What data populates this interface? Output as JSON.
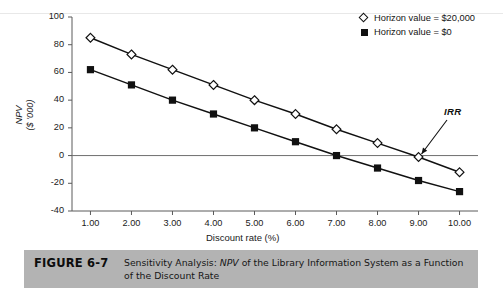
{
  "figure": {
    "label": "FIGURE 6-7",
    "caption_prefix": "Sensitivity Analysis: ",
    "caption_italic": "NPV",
    "caption_suffix": " of the Library Information System as a Function of the Discount Rate",
    "bar_color": "#b3b3b3"
  },
  "annotations": {
    "irr_label": "IRR"
  },
  "chart_data": {
    "type": "line",
    "title": "",
    "xlabel": "Discount rate (%)",
    "ylabel_line1": "NPV",
    "ylabel_line2": "($ '000)",
    "x": [
      1,
      2,
      3,
      4,
      5,
      6,
      7,
      8,
      9,
      10
    ],
    "categories": [
      "1.00",
      "2.00",
      "3.00",
      "4.00",
      "5.00",
      "6.00",
      "7.00",
      "8.00",
      "9.00",
      "10.00"
    ],
    "xtick_labels": [
      "1.00",
      "2.00",
      "3.00",
      "4.00",
      "5.00",
      "6.00",
      "7.00",
      "8.00",
      "9.00",
      "10.00"
    ],
    "ytick_labels": [
      "100",
      "80",
      "60",
      "40",
      "20",
      "0",
      "-20",
      "-40"
    ],
    "yticks": [
      100,
      80,
      60,
      40,
      20,
      0,
      -20,
      -40
    ],
    "xlim": [
      0.55,
      10.45
    ],
    "ylim": [
      -40,
      100
    ],
    "grid": false,
    "legend_position": "top-right",
    "zero_line": true,
    "series": [
      {
        "name": "Horizon value = $20,000",
        "marker": "open-diamond",
        "color": "#111111",
        "values": [
          85,
          73,
          62,
          51,
          40,
          30,
          19,
          9,
          -1,
          -12
        ]
      },
      {
        "name": "Horizon value = $0",
        "marker": "filled-square",
        "color": "#111111",
        "values": [
          62,
          51,
          40,
          30,
          20,
          10,
          0,
          -9,
          -18,
          -26
        ]
      }
    ],
    "annotations": [
      {
        "text": "IRR",
        "points_to_x": 9.0,
        "points_to_y": -1,
        "note": "internal rate of return where Horizon value = $20,000 curve crosses zero"
      }
    ]
  },
  "legend": {
    "items": [
      {
        "label": "Horizon value = $20,000",
        "marker": "open-diamond"
      },
      {
        "label": "Horizon value = $0",
        "marker": "filled-square"
      }
    ]
  }
}
